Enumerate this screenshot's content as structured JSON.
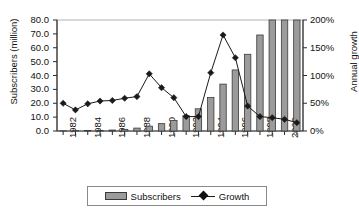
{
  "chart_data": {
    "type": "bar",
    "title": "",
    "xlabel": "",
    "ylabel": "Subscribers (million)",
    "y2label": "Annual growth",
    "grid": false,
    "legend_position": "bottom",
    "ylim": [
      0,
      80
    ],
    "y2lim": [
      0,
      200
    ],
    "ytick_labels": [
      "80.0",
      "70.0",
      "60.0",
      "50.0",
      "40.0",
      "30.0",
      "20.0",
      "10.0",
      "0.0"
    ],
    "ytick_values": [
      80,
      70,
      60,
      50,
      40,
      30,
      20,
      10,
      0
    ],
    "y2tick_labels": [
      "200%",
      "150%",
      "100%",
      "50%",
      "0%"
    ],
    "y2tick_values": [
      200,
      150,
      100,
      50,
      0
    ],
    "categories": [
      1982,
      1983,
      1984,
      1985,
      1986,
      1987,
      1988,
      1989,
      1990,
      1991,
      1992,
      1993,
      1994,
      1995,
      1996,
      1997,
      1998,
      1999,
      2000,
      2001
    ],
    "xtick_labels": [
      "1982",
      "1984",
      "1986",
      "1988",
      "1990",
      "1992",
      "1994",
      "1996",
      "1998",
      "2000"
    ],
    "xtick_values": [
      1982,
      1984,
      1986,
      1988,
      1990,
      1992,
      1994,
      1996,
      1998,
      2000
    ],
    "series": [
      {
        "name": "Subscribers",
        "type": "bar",
        "axis": "left",
        "unit": "million",
        "color": "#9b9b9b",
        "edge_color": "#3a3a3a",
        "values": [
          0.1,
          0.2,
          0.3,
          0.4,
          0.7,
          1.2,
          2.1,
          3.5,
          5.3,
          7.6,
          11.0,
          16.0,
          24.1,
          33.8,
          44.0,
          55.3,
          69.2,
          86.0,
          109.5,
          128.4
        ]
      },
      {
        "name": "Growth",
        "type": "line",
        "axis": "right",
        "unit": "percent",
        "color": "#1a1a1a",
        "marker": "diamond",
        "values": [
          50,
          38,
          49,
          54,
          55,
          59,
          62,
          103,
          78,
          60,
          26,
          26,
          105,
          173,
          132,
          45,
          26,
          24,
          21,
          15
        ]
      }
    ],
    "plot_area_px": {
      "left": 57,
      "right": 303,
      "top": 20,
      "bottom": 131
    }
  },
  "legend": {
    "subscribers_label": "Subscribers",
    "growth_label": "Growth"
  },
  "icons": {
    "bar_swatch": "bar-swatch-icon",
    "line_marker": "diamond-marker-icon"
  }
}
